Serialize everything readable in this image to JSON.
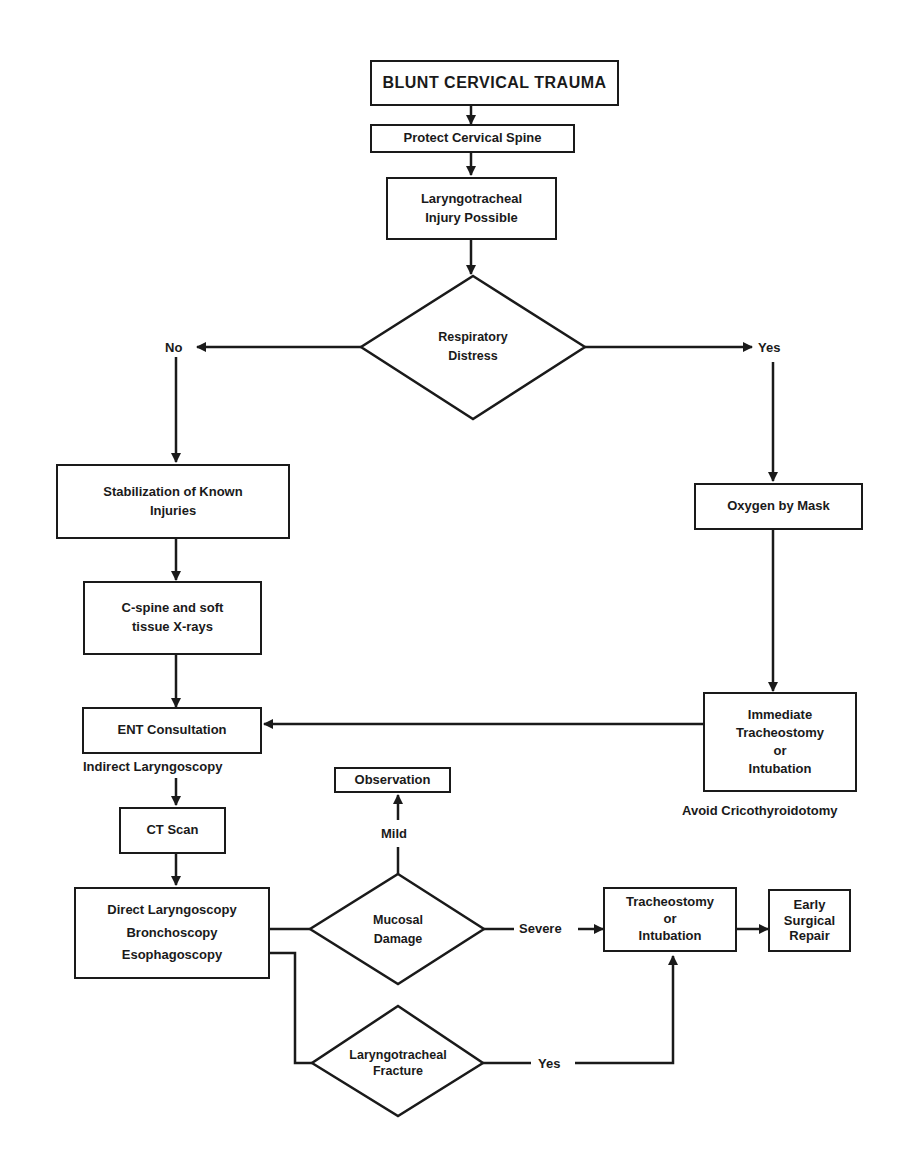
{
  "flowchart": {
    "title": "BLUNT CERVICAL TRAUMA",
    "nodes": {
      "protect_spine": "Protect Cervical Spine",
      "injury_possible": [
        "Laryngotracheal",
        "Injury Possible"
      ],
      "respiratory_distress": [
        "Respiratory",
        "Distress"
      ],
      "stabilization": [
        "Stabilization of Known",
        "Injuries"
      ],
      "xrays": [
        "C-spine and soft",
        "tissue X-rays"
      ],
      "ent_consultation": "ENT Consultation",
      "indirect_laryngoscopy": "Indirect Laryngoscopy",
      "ct_scan": "CT Scan",
      "direct_exam": [
        "Direct Laryngoscopy",
        "Bronchoscopy",
        "Esophagoscopy"
      ],
      "mucosal_damage": [
        "Mucosal",
        "Damage"
      ],
      "observation": "Observation",
      "laryngotracheal_fracture": [
        "Laryngotracheal",
        "Fracture"
      ],
      "oxygen_mask": "Oxygen by Mask",
      "immediate_trach": [
        "Immediate",
        "Tracheostomy",
        "or",
        "Intubation"
      ],
      "avoid_crico": "Avoid Cricothyroidotomy",
      "trach_or_intubation": [
        "Tracheostomy",
        "or",
        "Intubation"
      ],
      "early_repair": [
        "Early",
        "Surgical",
        "Repair"
      ]
    },
    "edge_labels": {
      "no": "No",
      "yes": "Yes",
      "mild": "Mild",
      "severe": "Severe",
      "fracture_yes": "Yes"
    },
    "colors": {
      "ink": "#1a1a1a",
      "background": "#ffffff"
    }
  }
}
